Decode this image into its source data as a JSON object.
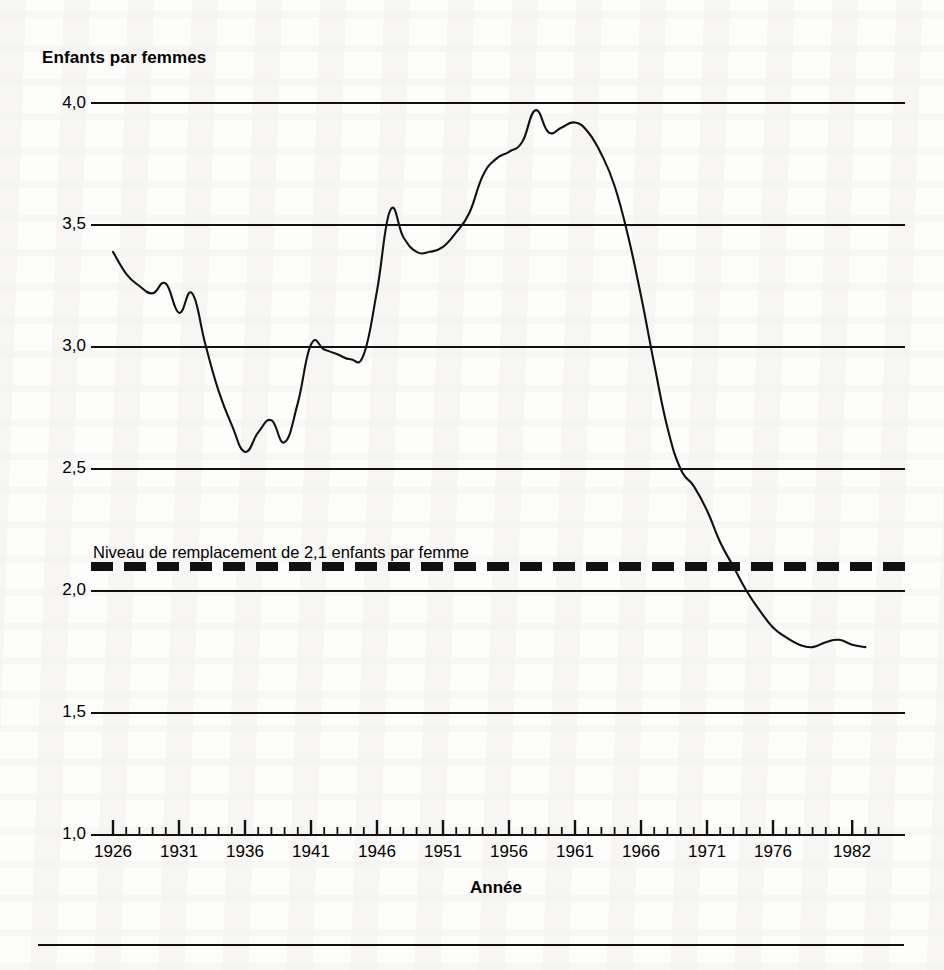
{
  "chart_data": {
    "type": "line",
    "title": "Enfants par femmes",
    "ylabel": "Enfants par femmes",
    "xlabel": "Année",
    "grid": true,
    "legend": "none",
    "xlim": [
      1925,
      1984
    ],
    "ylim": [
      1.0,
      4.0
    ],
    "yticks": [
      1.0,
      1.5,
      2.0,
      2.5,
      3.0,
      3.5,
      4.0
    ],
    "ytick_labels": [
      "1,0",
      "1,5",
      "2,0",
      "2,5",
      "3,0",
      "3,5",
      "4,0"
    ],
    "xticks_major": [
      1926,
      1931,
      1936,
      1941,
      1946,
      1951,
      1956,
      1961,
      1966,
      1971,
      1976,
      1982
    ],
    "xtick_labels": [
      "1926",
      "1931",
      "1936",
      "1941",
      "1946",
      "1951",
      "1956",
      "1961",
      "1966",
      "1971",
      "1976",
      "1982"
    ],
    "xtick_minor_step": 1,
    "series": [
      {
        "name": "Indice synthétique de fécondité",
        "style": "solid",
        "color": "#111111",
        "x": [
          1926,
          1927,
          1928,
          1929,
          1930,
          1931,
          1932,
          1933,
          1934,
          1935,
          1936,
          1937,
          1938,
          1939,
          1940,
          1941,
          1942,
          1943,
          1944,
          1945,
          1946,
          1947,
          1948,
          1949,
          1950,
          1951,
          1952,
          1953,
          1954,
          1955,
          1956,
          1957,
          1958,
          1959,
          1960,
          1961,
          1962,
          1963,
          1964,
          1965,
          1966,
          1967,
          1968,
          1969,
          1970,
          1971,
          1972,
          1973,
          1974,
          1975,
          1976,
          1977,
          1978,
          1979,
          1980,
          1981,
          1982,
          1983
        ],
        "y": [
          3.39,
          3.3,
          3.25,
          3.22,
          3.26,
          3.14,
          3.22,
          3.01,
          2.82,
          2.68,
          2.57,
          2.65,
          2.7,
          2.61,
          2.77,
          3.01,
          2.99,
          2.97,
          2.95,
          2.97,
          3.23,
          3.56,
          3.45,
          3.39,
          3.39,
          3.41,
          3.47,
          3.55,
          3.7,
          3.77,
          3.8,
          3.84,
          3.97,
          3.88,
          3.9,
          3.92,
          3.88,
          3.79,
          3.66,
          3.46,
          3.21,
          2.93,
          2.67,
          2.5,
          2.43,
          2.33,
          2.2,
          2.1,
          2.0,
          1.92,
          1.85,
          1.81,
          1.78,
          1.77,
          1.79,
          1.8,
          1.78,
          1.77
        ]
      },
      {
        "name": "Niveau de remplacement",
        "style": "dashed-thick",
        "color": "#111111",
        "value": 2.1,
        "label": "Niveau de remplacement de 2,1 enfants par femme"
      }
    ]
  },
  "axes": {
    "y_title": "Enfants par femmes",
    "x_title": "Année",
    "y_tick_labels": [
      "4,0",
      "3,5",
      "3,0",
      "2,5",
      "2,0",
      "1,5",
      "1,0"
    ],
    "x_tick_labels": [
      "1926",
      "1931",
      "1936",
      "1941",
      "1946",
      "1951",
      "1956",
      "1961",
      "1966",
      "1971",
      "1976",
      "1982"
    ]
  },
  "annotations": {
    "replacement_level": "Niveau de remplacement de 2,1 enfants par femme"
  },
  "colors": {
    "ink": "#111111",
    "paper": "#fdfdfc"
  }
}
